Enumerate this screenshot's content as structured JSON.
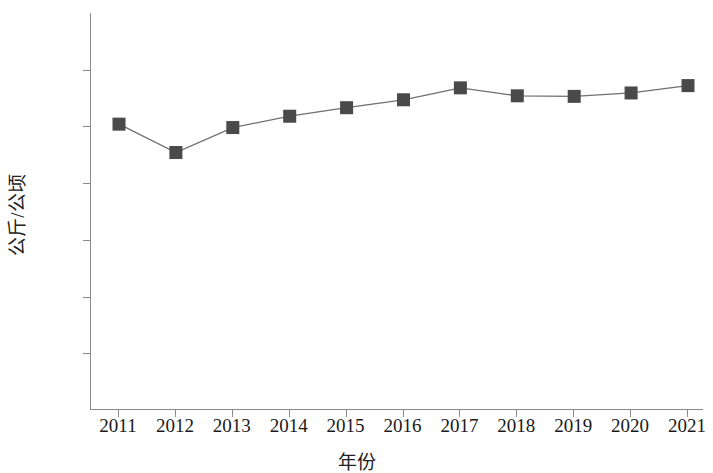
{
  "chart_data": {
    "type": "line",
    "title": "",
    "xlabel": "年份",
    "ylabel": "公斤/公顷",
    "categories": [
      "2011",
      "2012",
      "2013",
      "2014",
      "2015",
      "2016",
      "2017",
      "2018",
      "2019",
      "2020",
      "2021"
    ],
    "values": [
      2520,
      2270,
      2490,
      2590,
      2665,
      2735,
      2840,
      2770,
      2765,
      2795,
      2860
    ],
    "series": [
      {
        "name": "",
        "values": [
          2520,
          2270,
          2490,
          2590,
          2665,
          2735,
          2840,
          2770,
          2765,
          2795,
          2860
        ]
      }
    ],
    "ylim": [
      0,
      3500
    ],
    "ytick_values": [
      0,
      500,
      1000,
      1500,
      2000,
      2500,
      3000,
      3500
    ],
    "ytick_labels": [
      "0",
      "500",
      "1 000",
      "1 500",
      "2 000",
      "2 500",
      "3 000",
      "3 500"
    ],
    "xtick_labels": [
      "2011",
      "2012",
      "2013",
      "2014",
      "2015",
      "2016",
      "2017",
      "2018",
      "2019",
      "2020",
      "2021"
    ],
    "grid": false,
    "legend": false,
    "legend_position": "none",
    "marker": "square",
    "marker_color": "#4a4a4a",
    "line_color": "#6f6f6f",
    "axis_color": "#8a8a8a",
    "annotations": []
  }
}
